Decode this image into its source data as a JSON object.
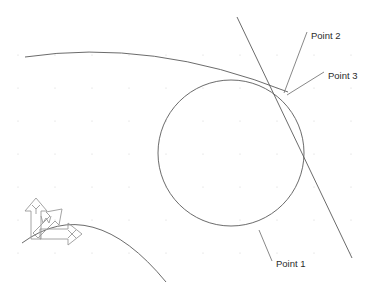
{
  "canvas": {
    "width": 385,
    "height": 282,
    "background_color": "#ffffff",
    "title": "Circle tangent construction"
  },
  "grid": {
    "visible": true,
    "dot_color": "#d2d2d2",
    "origin_x": 18,
    "origin_y": 55,
    "spacing_x": 37,
    "spacing_y": 33,
    "dot_radius": 0.6
  },
  "style": {
    "geometry_color": "#5a5a5a",
    "construction_color": "#7b7b7b",
    "leader_color": "#6a6a6a",
    "axis_color": "#9a9a9a",
    "text_color": "#2b2b2b"
  },
  "labels": {
    "point1": "Point 1",
    "point2": "Point 2",
    "point3": "Point 3"
  },
  "axis_indicator": {
    "name": "coordinate-axis-triad",
    "x_axis_label": "X",
    "y_axis_label": "Y",
    "w_axis_label": "W",
    "origin_x": 40,
    "origin_y": 240
  },
  "chart_data": {
    "type": "scatter",
    "xlabel": "",
    "ylabel": "",
    "xlim": [
      0,
      385
    ],
    "ylim": [
      282,
      0
    ],
    "grid": true,
    "legend": "none",
    "entities": [
      {
        "name": "main-circle",
        "kind": "circle",
        "cx": 231,
        "cy": 153,
        "r": 73
      },
      {
        "name": "upper-arc",
        "kind": "arc",
        "start": [
          25,
          57
        ],
        "control": [
          152,
          38
        ],
        "end": [
          288,
          92
        ]
      },
      {
        "name": "tangent-line",
        "kind": "line",
        "start": [
          237,
          17
        ],
        "end": [
          352,
          258
        ]
      },
      {
        "name": "lower-left-arc",
        "kind": "arc",
        "start": [
          22,
          243
        ],
        "control": [
          92,
          192
        ],
        "end": [
          166,
          282
        ]
      }
    ],
    "annotations": [
      {
        "label": "Point 1",
        "text_x": 276,
        "text_y": 266,
        "leader_from": [
          272,
          262
        ],
        "leader_to": [
          259,
          230
        ]
      },
      {
        "label": "Point 2",
        "text_x": 310,
        "text_y": 38,
        "leader_from": [
          306,
          34
        ],
        "leader_to": [
          284,
          93
        ]
      },
      {
        "label": "Point 3",
        "text_x": 327,
        "text_y": 78,
        "leader_from": [
          323,
          74
        ],
        "leader_to": [
          287,
          95
        ]
      }
    ]
  }
}
